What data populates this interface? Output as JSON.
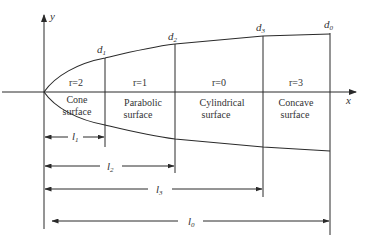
{
  "diagram": {
    "axes": {
      "x_label": "x",
      "y_label": "y"
    },
    "sections": [
      {
        "diameter_label": "d",
        "diameter_sub": "1",
        "r_label": "r=2",
        "surface_line1": "Cone",
        "surface_line2": "surface",
        "length_label": "l",
        "length_sub": "1"
      },
      {
        "diameter_label": "d",
        "diameter_sub": "2",
        "r_label": "r=1",
        "surface_line1": "Parabolic",
        "surface_line2": "surface",
        "length_label": "l",
        "length_sub": "2"
      },
      {
        "diameter_label": "d",
        "diameter_sub": "3",
        "r_label": "r=0",
        "surface_line1": "Cylindrical",
        "surface_line2": "surface",
        "length_label": "l",
        "length_sub": "3"
      },
      {
        "diameter_label": "d",
        "diameter_sub": "0",
        "r_label": "r=3",
        "surface_line1": "Concave",
        "surface_line2": "surface",
        "length_label": "l",
        "length_sub": "0"
      }
    ],
    "colors": {
      "line": "#2a2a2a",
      "text": "#333333",
      "background": "#ffffff"
    }
  }
}
